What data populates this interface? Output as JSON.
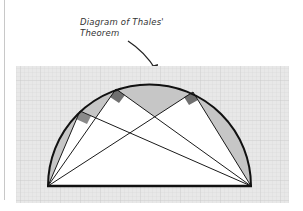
{
  "caption": {
    "line1": "Diagram of Thales'",
    "line2": "Theorem"
  },
  "colors": {
    "grid_bg": "#e6e6e6",
    "grid_line": "#d2d2d2",
    "segment_fill": "#c4c4c4",
    "triangle_fill": "#ffffff",
    "right_angle_marker": "#7a7a7a",
    "stroke": "#111111"
  },
  "diagram": {
    "title": "Thales' Theorem",
    "semicircle": {
      "cx": 149.5,
      "cy": 186,
      "r": 101
    },
    "diameter": {
      "a": [
        48,
        186
      ],
      "b": [
        251,
        186
      ]
    },
    "vertices_on_arc": [
      [
        80,
        111
      ],
      [
        116,
        89
      ],
      [
        193,
        92
      ]
    ],
    "right_angles_count": 3
  }
}
